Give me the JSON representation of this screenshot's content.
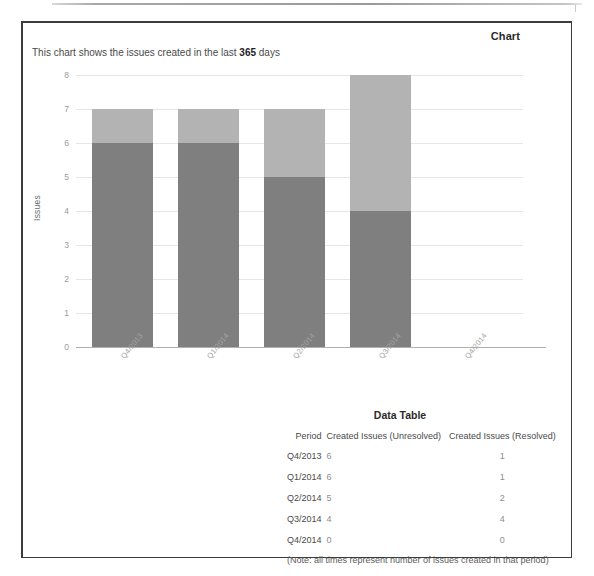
{
  "panel": {
    "chart_heading": "Chart",
    "subtitle_prefix": "This chart shows the issues created in the last ",
    "subtitle_highlight": "365",
    "subtitle_suffix": " days",
    "table_heading": "Data Table",
    "table_note": "(Note: all times represent number of issues created in that period)"
  },
  "table": {
    "columns": [
      "Period",
      "Created Issues (Unresolved)",
      "Created Issues (Resolved)"
    ],
    "rows": [
      {
        "period": "Q4/2013",
        "unresolved": "6",
        "resolved": "1"
      },
      {
        "period": "Q1/2014",
        "unresolved": "6",
        "resolved": "1"
      },
      {
        "period": "Q2/2014",
        "unresolved": "5",
        "resolved": "2"
      },
      {
        "period": "Q3/2014",
        "unresolved": "4",
        "resolved": "4"
      },
      {
        "period": "Q4/2014",
        "unresolved": "0",
        "resolved": "0"
      }
    ]
  },
  "chart_data": {
    "type": "bar",
    "title": "Chart",
    "subtitle": "This chart shows the issues created in the last 365 days",
    "xlabel": "",
    "ylabel": "Issues",
    "ylim": [
      0,
      8
    ],
    "yticks": [
      "0",
      "1",
      "2",
      "3",
      "4",
      "5",
      "6",
      "7",
      "8"
    ],
    "grid": true,
    "stacked": true,
    "legend": "none",
    "categories": [
      "Q4/2013",
      "Q1/2014",
      "Q2/2014",
      "Q3/2014",
      "Q4/2014"
    ],
    "series": [
      {
        "name": "Created Issues (Unresolved)",
        "color": "#7f7f7f",
        "values": [
          6,
          6,
          5,
          4,
          0
        ]
      },
      {
        "name": "Created Issues (Resolved)",
        "color": "#b3b3b3",
        "values": [
          1,
          1,
          2,
          4,
          0
        ]
      }
    ],
    "totals": [
      7,
      7,
      7,
      8,
      0
    ]
  },
  "colors": {
    "unresolved": "#7f7f7f",
    "resolved": "#b3b3b3",
    "gridline": "#e6e6e6",
    "axis": "#b0b0b0",
    "border": "#3c3c3c"
  }
}
